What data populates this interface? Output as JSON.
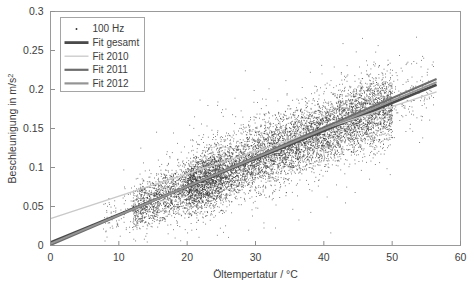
{
  "chart_data": {
    "type": "scatter",
    "title": "",
    "xlabel": "Öltempertatur / °C",
    "ylabel": "Beschleunigung in m/s²",
    "ylabel_base": "Beschleunigung in m/s",
    "ylabel_exponent": "2",
    "xlim": [
      0,
      60
    ],
    "ylim": [
      0,
      0.3
    ],
    "xticks": [
      0,
      10,
      20,
      30,
      40,
      50,
      60
    ],
    "xtick_labels": [
      "0",
      "10",
      "20",
      "30",
      "40",
      "50",
      "60"
    ],
    "yticks": [
      0,
      0.05,
      0.1,
      0.15,
      0.2,
      0.25,
      0.3
    ],
    "ytick_labels": [
      "0",
      "0.05",
      "0.1",
      "0.15",
      "0.2",
      "0.25",
      "0.3"
    ],
    "grid": false,
    "legend_position": "upper-left",
    "scatter_series": {
      "name": "100 Hz",
      "marker": "point",
      "color": "#2f2f2f",
      "n_points": 9000,
      "x_range": [
        7.5,
        56.0
      ],
      "y_range": [
        0.02,
        0.265
      ],
      "description": "Dense point cloud of measured acceleration versus oil temperature, rising roughly linearly from about 0.055 m/s² at 10 °C to about 0.20 m/s² at 55 °C, with vertical spread of roughly ±0.045 m/s² and highest density between 20 °C and 50 °C.",
      "trend_intercept": 0.004,
      "trend_slope": 0.00355,
      "spread": 0.042
    },
    "fit_series": [
      {
        "name": "Fit gesamt",
        "color": "#4a4a4a",
        "width": 2.6,
        "x_start": 0.0,
        "x_end": 56.5,
        "y_start": 0.004,
        "y_end": 0.206
      },
      {
        "name": "Fit 2010",
        "color": "#c9c9c9",
        "width": 1.5,
        "x_start": 0.0,
        "x_end": 56.5,
        "y_start": 0.0345,
        "y_end": 0.197
      },
      {
        "name": "Fit 2011",
        "color": "#6d6d6d",
        "width": 2.0,
        "x_start": 0.0,
        "x_end": 56.5,
        "y_start": 0.0005,
        "y_end": 0.2135
      },
      {
        "name": "Fit 2012",
        "color": "#949494",
        "width": 2.0,
        "x_start": 0.0,
        "x_end": 56.5,
        "y_start": 0.0025,
        "y_end": 0.2095
      }
    ],
    "legend_entries": [
      {
        "label": "100 Hz",
        "type": "marker",
        "color": "#2f2f2f"
      },
      {
        "label": "Fit gesamt",
        "type": "line",
        "color": "#4a4a4a",
        "width": 2.8
      },
      {
        "label": "Fit 2010",
        "type": "line",
        "color": "#cccccc",
        "width": 1.4
      },
      {
        "label": "Fit 2011",
        "type": "line",
        "color": "#6d6d6d",
        "width": 2.2
      },
      {
        "label": "Fit 2012",
        "type": "line",
        "color": "#949494",
        "width": 2.2
      }
    ]
  }
}
